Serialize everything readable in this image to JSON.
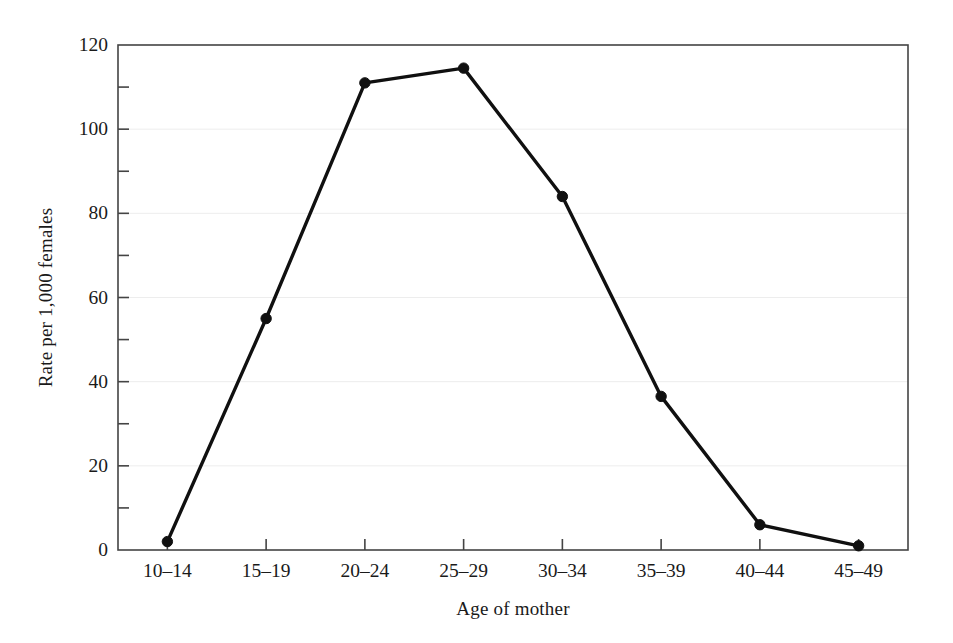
{
  "chart_data": {
    "type": "line",
    "title": "",
    "xlabel": "Age of mother",
    "ylabel": "Rate per 1,000 females",
    "categories": [
      "10–14",
      "15–19",
      "20–24",
      "25–29",
      "30–34",
      "35–39",
      "40–44",
      "45–49"
    ],
    "values": [
      2,
      55,
      111,
      114.5,
      84,
      36.5,
      6,
      1
    ],
    "series": [
      {
        "name": "Birth rate",
        "values": [
          2,
          55,
          111,
          114.5,
          84,
          36.5,
          6,
          1
        ]
      }
    ],
    "ylim": [
      0,
      120
    ],
    "ytick_major": [
      0,
      20,
      40,
      60,
      80,
      100,
      120
    ],
    "ytick_major_labels": [
      "0",
      "20",
      "40",
      "60",
      "80",
      "100",
      "120"
    ],
    "ytick_minor": [
      10,
      30,
      50,
      70,
      90,
      110
    ],
    "grid": "horizontal-major-faint",
    "legend": "none",
    "line_color": "#101010",
    "marker_color": "#101010",
    "marker_shape": "circle",
    "axis_color": "#444444",
    "grid_color": "#ededed",
    "background": "#ffffff"
  },
  "plot": {
    "left": 118,
    "right": 908,
    "top": 45,
    "bottom": 550
  }
}
